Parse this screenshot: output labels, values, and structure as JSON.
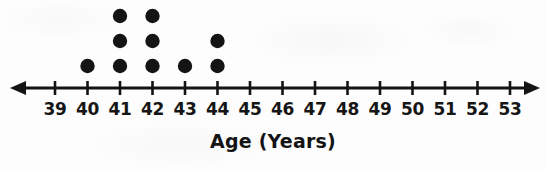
{
  "figure": {
    "type": "dot-plot",
    "axis_title": "Age (Years)",
    "ink_color": "#141414",
    "background_color": "#fdfdfd"
  },
  "chart_data": {
    "type": "scatter",
    "plot_style": "dot plot (stacked dots on a number line)",
    "title": "",
    "subtitle": "",
    "xlabel": "Age (Years)",
    "ylabel": "",
    "grid": false,
    "legend": null,
    "xlim": [
      39,
      53
    ],
    "xtick_labels": [
      "39",
      "40",
      "41",
      "42",
      "43",
      "44",
      "45",
      "46",
      "47",
      "48",
      "49",
      "50",
      "51",
      "52",
      "53"
    ],
    "categories": [
      39,
      40,
      41,
      42,
      43,
      44,
      45,
      46,
      47,
      48,
      49,
      50,
      51,
      52,
      53
    ],
    "values": [
      0,
      1,
      3,
      3,
      1,
      2,
      0,
      0,
      0,
      0,
      0,
      0,
      0,
      0,
      0
    ],
    "series": [
      {
        "name": "Count of people",
        "values": [
          0,
          1,
          3,
          3,
          1,
          2,
          0,
          0,
          0,
          0,
          0,
          0,
          0,
          0,
          0
        ]
      }
    ],
    "data_points": [
      40,
      41,
      41,
      41,
      42,
      42,
      42,
      43,
      44,
      44
    ],
    "total_dots": 10,
    "max_stack_height": 3,
    "axis_arrows": "both",
    "dot_color": "#141414"
  }
}
